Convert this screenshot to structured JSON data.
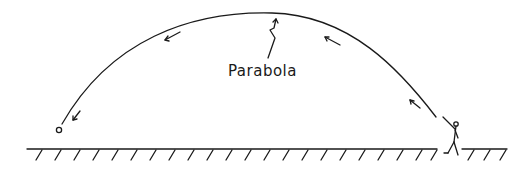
{
  "diagram": {
    "label": "Parabola",
    "elements": [
      "ground",
      "thrower-figure",
      "parabolic-trajectory",
      "direction-arrows",
      "ball"
    ]
  }
}
